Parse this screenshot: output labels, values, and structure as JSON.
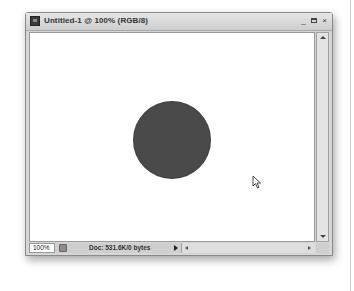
{
  "window": {
    "title": "Untitled-1 @ 100% (RGB/8)",
    "controls": {
      "minimize": "_",
      "maximize": "□",
      "close": "×"
    }
  },
  "canvas": {
    "shape": "circle",
    "fill_color": "#4a4a4a",
    "background": "#ffffff"
  },
  "statusbar": {
    "zoom": "100%",
    "doc_info": "Doc: 531.6K/0 bytes"
  },
  "colors": {
    "chrome": "#d6d6d6",
    "titlebar": "#cdcdcd",
    "circle": "#4a4a4a"
  }
}
